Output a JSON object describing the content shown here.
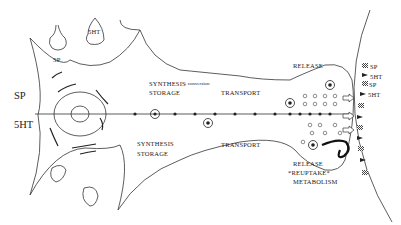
{
  "diagram": {
    "type": "neuron-schematic",
    "soma_labels": {
      "left_top": "SP",
      "left_bottom": "5HT",
      "terminal_top": "SP",
      "terminal_top_right": "5HT"
    },
    "axon_labels": {
      "top_synthesis": "SYNTHESIS",
      "top_conversion": "; conversion",
      "top_storage": "STORAGE",
      "top_transport": "TRANSPORT",
      "bottom_synthesis": "SYNTHESIS",
      "bottom_storage": "STORAGE",
      "bottom_transport": "TRANSPORT"
    },
    "terminal_labels": {
      "release_top": "RELEASE",
      "release_bottom": "RELEASE",
      "reuptake": "*REUPTAKE*",
      "metabolism": "METABOLISM"
    },
    "receptor_labels": [
      {
        "text": "5HT",
        "marker": "triangle"
      },
      {
        "text": "SP",
        "marker": "hatched-square"
      },
      {
        "text": "5HT",
        "marker": "triangle"
      },
      {
        "text": "SP",
        "marker": "hatched-square"
      }
    ]
  }
}
